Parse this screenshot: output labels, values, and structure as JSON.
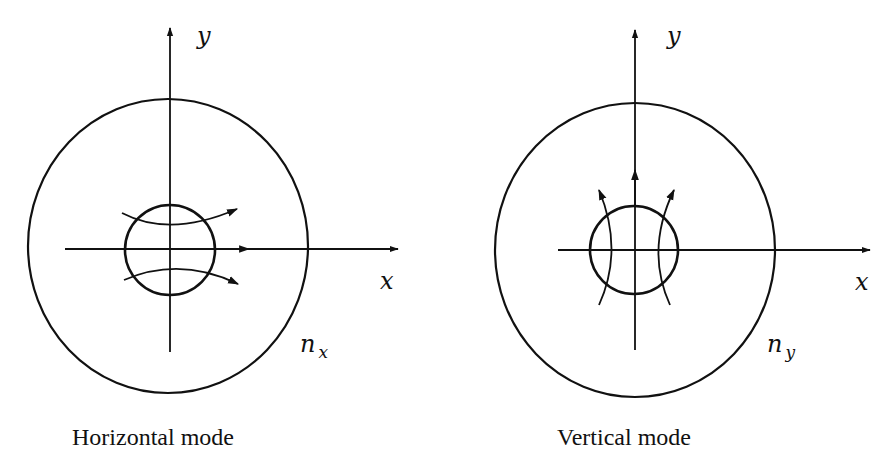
{
  "figure": {
    "panels": [
      {
        "id": "horizontal",
        "caption": "Horizontal mode",
        "axis_x_label": "x",
        "axis_y_label": "y",
        "index_label_main": "n",
        "index_label_sub": "x",
        "field_direction": "horizontal"
      },
      {
        "id": "vertical",
        "caption": "Vertical mode",
        "axis_x_label": "x",
        "axis_y_label": "y",
        "index_label_main": "n",
        "index_label_sub": "y",
        "field_direction": "vertical"
      }
    ],
    "colors": {
      "ink": "#111111",
      "background": "#ffffff"
    }
  }
}
